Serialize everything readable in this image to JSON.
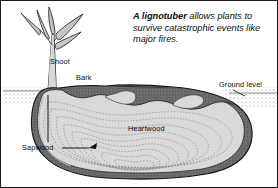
{
  "figure": {
    "border_color": "#1a1a1a",
    "background": "#ffffff"
  },
  "caption": {
    "lead": "A lignotuber",
    "rest": " allows plants to survive catastrophic events like major fires.",
    "full": "A lignotuber allows plants to survive catastrophic events like major fires."
  },
  "labels": {
    "shoot": "Shoot",
    "bark": "Bark",
    "ground_level": "Ground level",
    "heartwood": "Heartwood",
    "sapwood": "Sapwood"
  },
  "palette": {
    "outline": "#111111",
    "bark_dark": "#6b6b6b",
    "bark_darker": "#4a4a4a",
    "sapwood": "#d9d9d7",
    "heartwood": "#d2d2d0",
    "ring_line": "#8a8a88",
    "leaf_fill": "#c9c9c7",
    "soil_stipple": "#7d7d7b",
    "stem": "#d8d8d6",
    "leader_line": "#0d0d0d"
  },
  "diagram": {
    "type": "botanical-cross-section",
    "parts": [
      {
        "name": "shoot",
        "description": "young stem with leaves above ground"
      },
      {
        "name": "bark",
        "description": "dark outer layer surrounding the lignotuber"
      },
      {
        "name": "sapwood",
        "description": "pale layer just inside the bark"
      },
      {
        "name": "heartwood",
        "description": "central mass with concentric growth rings"
      },
      {
        "name": "ground-level",
        "description": "stippled soil line on both sides"
      }
    ],
    "growth_rings": 9
  }
}
